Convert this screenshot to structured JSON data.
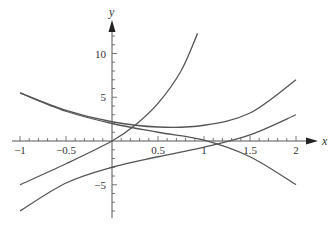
{
  "chart_data": {
    "type": "line",
    "title": "",
    "xlabel": "x",
    "ylabel": "y",
    "xlim": [
      -1,
      2.15
    ],
    "ylim": [
      -9,
      13
    ],
    "grid": false,
    "legend": null,
    "x_ticks": [
      -1,
      -0.5,
      0.5,
      1,
      1.5,
      2
    ],
    "x_tick_labels": [
      "−1",
      "−0.5",
      "0.5",
      "1",
      "1.5",
      "2"
    ],
    "y_ticks": [
      -5,
      5,
      10
    ],
    "y_tick_labels": [
      "−5",
      "5",
      "10"
    ],
    "series": [
      {
        "name": "steep-curve",
        "points": [
          [
            -1,
            -5
          ],
          [
            -0.5,
            -2.6
          ],
          [
            0,
            0
          ],
          [
            0.25,
            1.8
          ],
          [
            0.5,
            4.3
          ],
          [
            0.75,
            8
          ],
          [
            0.93,
            12.3
          ]
        ]
      },
      {
        "name": "upper-u-curve",
        "points": [
          [
            -1,
            5.5
          ],
          [
            -0.5,
            3.5
          ],
          [
            0,
            2.2
          ],
          [
            0.5,
            1.6
          ],
          [
            1,
            1.8
          ],
          [
            1.5,
            3.2
          ],
          [
            2,
            7
          ]
        ]
      },
      {
        "name": "descending-curve",
        "points": [
          [
            -1,
            5.5
          ],
          [
            -0.5,
            3.4
          ],
          [
            0,
            2.0
          ],
          [
            0.5,
            1.0
          ],
          [
            1,
            0.1
          ],
          [
            1.5,
            -1.8
          ],
          [
            2,
            -5
          ]
        ]
      },
      {
        "name": "lower-rising-curve",
        "points": [
          [
            -1,
            -8
          ],
          [
            -0.5,
            -4.8
          ],
          [
            0,
            -3
          ],
          [
            0.5,
            -1.8
          ],
          [
            1,
            -0.7
          ],
          [
            1.5,
            0.7
          ],
          [
            2,
            3
          ]
        ]
      }
    ],
    "line_color": "#555555"
  },
  "layout": {
    "origin_px": [
      112,
      141
    ],
    "x_scale": 92,
    "y_scale": 8.75
  }
}
